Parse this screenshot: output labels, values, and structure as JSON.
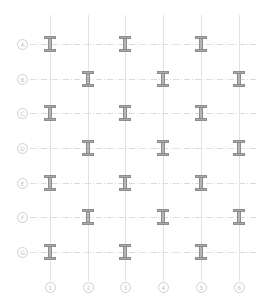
{
  "diagram": {
    "colors": {
      "grid_line": "#e2e2e2",
      "bubble": "#cfcfcf",
      "beam_fill": "#a9a9a9",
      "beam_outline": "#8d8d8d"
    },
    "rows": [
      {
        "label": "A",
        "y": 44
      },
      {
        "label": "B",
        "y": 79
      },
      {
        "label": "C",
        "y": 113
      },
      {
        "label": "D",
        "y": 148
      },
      {
        "label": "E",
        "y": 183
      },
      {
        "label": "F",
        "y": 217
      },
      {
        "label": "G",
        "y": 252
      }
    ],
    "columns": [
      {
        "label": "1",
        "x": 50
      },
      {
        "label": "2",
        "x": 88
      },
      {
        "label": "3",
        "x": 125
      },
      {
        "label": "4",
        "x": 163
      },
      {
        "label": "5",
        "x": 201
      },
      {
        "label": "6",
        "x": 239
      }
    ],
    "beam_icon": "i-beam-icon",
    "beams": [
      {
        "row": "A",
        "col": "1"
      },
      {
        "row": "A",
        "col": "3"
      },
      {
        "row": "A",
        "col": "5"
      },
      {
        "row": "B",
        "col": "2"
      },
      {
        "row": "B",
        "col": "4"
      },
      {
        "row": "B",
        "col": "6"
      },
      {
        "row": "C",
        "col": "1"
      },
      {
        "row": "C",
        "col": "3"
      },
      {
        "row": "C",
        "col": "5"
      },
      {
        "row": "D",
        "col": "2"
      },
      {
        "row": "D",
        "col": "4"
      },
      {
        "row": "D",
        "col": "6"
      },
      {
        "row": "E",
        "col": "1"
      },
      {
        "row": "E",
        "col": "3"
      },
      {
        "row": "E",
        "col": "5"
      },
      {
        "row": "F",
        "col": "2"
      },
      {
        "row": "F",
        "col": "4"
      },
      {
        "row": "F",
        "col": "6"
      },
      {
        "row": "G",
        "col": "1"
      },
      {
        "row": "G",
        "col": "3"
      },
      {
        "row": "G",
        "col": "5"
      }
    ]
  }
}
